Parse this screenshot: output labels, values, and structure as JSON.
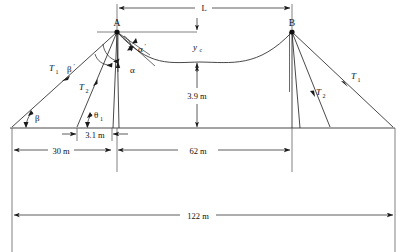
{
  "figure": {
    "type": "engineering-diagram",
    "background_color": "#ffffff",
    "line_color": "#1a1a1a"
  },
  "nodes": [
    {
      "id": "A",
      "label": "A",
      "x": 117,
      "y": 32
    },
    {
      "id": "B",
      "label": "B",
      "x": 292,
      "y": 32
    }
  ],
  "dimensions": {
    "span_L": {
      "label": "L",
      "value": "L",
      "y": 8,
      "x1": 117,
      "x2": 292
    },
    "sag_yc": {
      "label": "y",
      "sub": "c",
      "value": "y_c",
      "x": 200,
      "y1": 32,
      "y2": 62
    },
    "clearance": {
      "label": "3.9 m",
      "value": 3.9,
      "unit": "m",
      "x": 200,
      "y1": 62,
      "y2": 128
    },
    "left_offset": {
      "label": "30 m",
      "value": 30,
      "unit": "m",
      "x1": 12,
      "x2": 112,
      "y": 150
    },
    "pole_offset": {
      "label": "3.1 m",
      "value": 3.1,
      "unit": "m",
      "x1": 77,
      "x2": 112,
      "y": 134
    },
    "mid_span": {
      "label": "62 m",
      "value": 62,
      "unit": "m",
      "x1": 117,
      "x2": 292,
      "y": 150
    },
    "total": {
      "label": "122 m",
      "value": 122,
      "unit": "m",
      "x1": 12,
      "x2": 395,
      "y": 215
    }
  },
  "force_labels": {
    "T1_left": {
      "label": "T",
      "sub": "1",
      "x": 52,
      "y": 68
    },
    "T2_left": {
      "label": "T",
      "sub": "2",
      "x": 84,
      "y": 88
    },
    "T1_right": {
      "label": "T",
      "sub": "1",
      "x": 355,
      "y": 76
    },
    "T2_right": {
      "label": "T",
      "sub": "2",
      "x": 320,
      "y": 92
    }
  },
  "angle_labels": {
    "beta": {
      "label": "β",
      "x": 34,
      "y": 121
    },
    "beta_prime": {
      "label": "β",
      "prime": "′",
      "x": 71,
      "y": 70
    },
    "theta1": {
      "label": "θ",
      "sub": "1",
      "x": 96,
      "y": 117
    },
    "alpha": {
      "label": "α",
      "x": 132,
      "y": 70
    },
    "alpha_prime": {
      "label": "α",
      "prime": "′",
      "x": 140,
      "y": 50
    }
  },
  "geometry": {
    "ground_y": 128,
    "ground_x1": 10,
    "ground_x2": 395,
    "catenary_low_y": 62,
    "anchors": {
      "T1_left_ground_x": 12,
      "T2_left_ground_x": 77,
      "T1_right_ground_x": 393,
      "T2_right_ground_x": 330
    }
  }
}
